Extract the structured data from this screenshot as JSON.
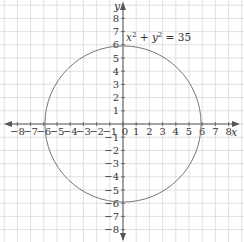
{
  "chart_data": {
    "type": "line",
    "title": "",
    "equation_label": "x² + y² = 35",
    "xlabel": "x",
    "ylabel": "y",
    "xlim": [
      -8,
      8
    ],
    "ylim": [
      -8,
      8
    ],
    "x_ticks": [
      -8,
      -7,
      -6,
      -5,
      -4,
      -3,
      -2,
      -1,
      0,
      1,
      2,
      3,
      4,
      5,
      6,
      7,
      8
    ],
    "y_ticks": [
      -8,
      -7,
      -6,
      -5,
      -4,
      -3,
      -2,
      -1,
      1,
      2,
      3,
      4,
      5,
      6,
      7,
      8
    ],
    "grid": true,
    "series": [
      {
        "name": "circle",
        "shape": "circle",
        "center": [
          0,
          0
        ],
        "radius_squared": 35,
        "radius": 5.916
      }
    ]
  },
  "labels": {
    "equation": "x² + y² = 35",
    "x_axis": "x",
    "y_axis": "y",
    "origin": "0"
  },
  "colors": {
    "grid": "#d9d9d9",
    "axis": "#555555",
    "curve": "#777777"
  }
}
